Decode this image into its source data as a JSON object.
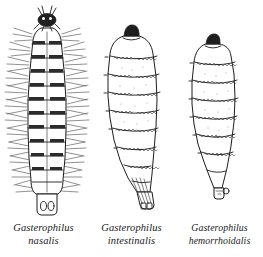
{
  "figure": {
    "kind": "scientific-illustration-plate",
    "background_color": "#ffffff",
    "ink_color": "#1a1a1a",
    "specimen_count": 3
  },
  "specimens": [
    {
      "index": 1,
      "genus": "Gasterophilus",
      "species": "nasalis",
      "shape": "slender elongate larva",
      "features": "dense dark spine bands at each segment border with long lateral setae radiating outward; small dark head knob with paired antennal projections; rounded posterior bearing two oval spiracular plates",
      "segment_bands": 11
    },
    {
      "index": 2,
      "genus": "Gasterophilus",
      "species": "intestinalis",
      "shape": "plump barrel-shaped maggot tapering posteriorly",
      "features": "dark cephalic cap; two rows of small squiggly spines per segment band arranged in left and right groups; narrow tapered posterior with small spiracular plate",
      "segment_bands": 9
    },
    {
      "index": 3,
      "genus": "Gasterophilus",
      "species": "hemorrhoidalis",
      "shape": "broad anteriorly, tapering to a pointed posterior",
      "features": "dark cephalic cap; paired rows of fine spines along segment borders; narrow pointed posterior tip with small knob-like spiracular plate",
      "segment_bands": 9
    }
  ]
}
